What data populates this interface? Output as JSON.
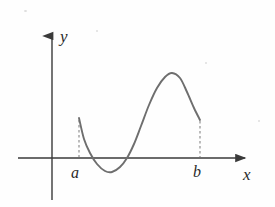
{
  "figure": {
    "type": "math-graph",
    "background_color": "#fefefe",
    "axis_color": "#3a3a3a",
    "curve_color": "#6e6e6e",
    "dash_color": "#8a8a8a",
    "label_color": "#2a2a2a"
  },
  "axes": {
    "y_axis": {
      "label": "y",
      "x": 52,
      "top": 30,
      "bottom": 200,
      "arrow": "up"
    },
    "x_axis": {
      "label": "x",
      "y": 158,
      "left": 18,
      "right": 250,
      "arrow": "right"
    }
  },
  "marks": [
    {
      "name": "interval-left-endpoint",
      "label": "a",
      "x": 79,
      "axis_y": 158,
      "curve_y": 118,
      "dashed": true
    },
    {
      "name": "interval-right-endpoint",
      "label": "b",
      "x": 200,
      "axis_y": 158,
      "curve_y": 120,
      "dashed": true
    }
  ],
  "chart_data": {
    "type": "line",
    "title": "",
    "xlabel": "x",
    "ylabel": "y",
    "grid": false,
    "legend": null,
    "annotations": [
      "a",
      "b"
    ],
    "interval": [
      "a",
      "b"
    ],
    "curve_points": [
      [
        79,
        118
      ],
      [
        84,
        139
      ],
      [
        90,
        153
      ],
      [
        97,
        164
      ],
      [
        105,
        171
      ],
      [
        112,
        172
      ],
      [
        120,
        167
      ],
      [
        127,
        158
      ],
      [
        134,
        144
      ],
      [
        141,
        126
      ],
      [
        149,
        105
      ],
      [
        157,
        88
      ],
      [
        165,
        77
      ],
      [
        172,
        73
      ],
      [
        180,
        78
      ],
      [
        187,
        92
      ],
      [
        194,
        108
      ],
      [
        200,
        120
      ]
    ],
    "features": {
      "left_endpoint": {
        "x": 79,
        "y": 118,
        "note": "curve begins at x = a"
      },
      "local_minimum": {
        "x": 110,
        "y": 172,
        "note": "below x-axis"
      },
      "zero_crossing_down": {
        "x": 92,
        "y": 158
      },
      "zero_crossing_up": {
        "x": 128,
        "y": 158
      },
      "local_maximum": {
        "x": 170,
        "y": 72,
        "note": "above x-axis"
      },
      "right_endpoint": {
        "x": 200,
        "y": 120,
        "note": "curve ends at x = b"
      }
    }
  }
}
